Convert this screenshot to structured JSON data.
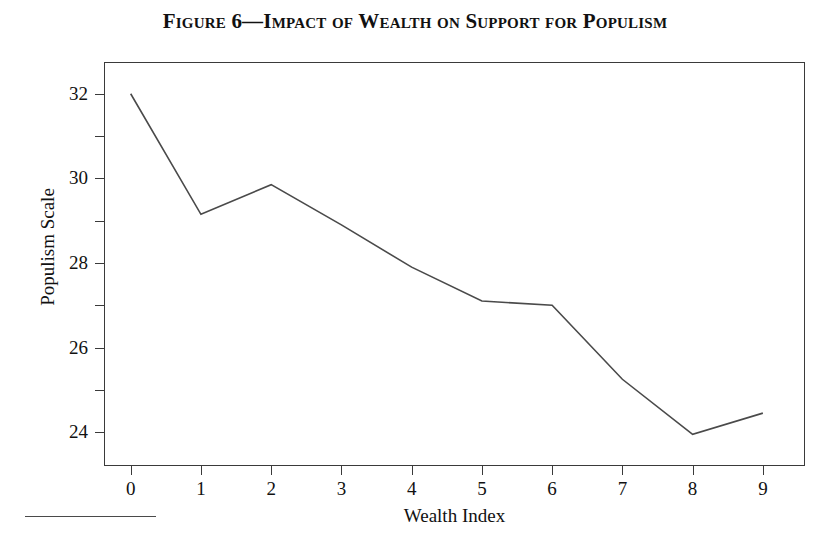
{
  "figure": {
    "label": "Figure 6",
    "dash": "—",
    "title_rest": "Impact of Wealth on Support for Populism",
    "full_title": "Figure 6—Impact of Wealth on Support for Populism"
  },
  "chart_data": {
    "type": "line",
    "title": "Figure 6—Impact of Wealth on Support for Populism",
    "xlabel": "Wealth Index",
    "ylabel": "Populism Scale",
    "x": [
      0,
      1,
      2,
      3,
      4,
      5,
      6,
      7,
      8,
      9
    ],
    "categories": [
      "0",
      "1",
      "2",
      "3",
      "4",
      "5",
      "6",
      "7",
      "8",
      "9"
    ],
    "values": [
      32.0,
      29.15,
      29.85,
      28.9,
      27.9,
      27.1,
      27.0,
      25.25,
      23.95,
      24.45
    ],
    "series": [
      {
        "name": "Populism Scale",
        "values": [
          32.0,
          29.15,
          29.85,
          28.9,
          27.9,
          27.1,
          27.0,
          25.25,
          23.95,
          24.45
        ]
      }
    ],
    "xlim": [
      -0.38,
      9.6
    ],
    "ylim": [
      23.2,
      32.75
    ],
    "ytick_major": [
      24,
      26,
      28,
      30,
      32
    ],
    "ytick_minor": [
      25,
      27,
      29,
      31
    ],
    "ytick_labels": [
      "24",
      "26",
      "28",
      "30",
      "32"
    ],
    "xtick_labels": [
      "0",
      "1",
      "2",
      "3",
      "4",
      "5",
      "6",
      "7",
      "8",
      "9"
    ],
    "grid": false,
    "legend": false,
    "line_color": "#4a4a4a",
    "frame_color": "#3a3a3a",
    "background": "#ffffff"
  }
}
